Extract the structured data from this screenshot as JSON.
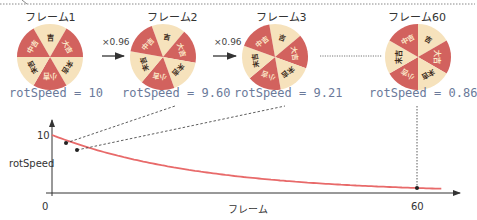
{
  "frames": [
    {
      "label": "フレーム1",
      "speed": "rotSpeed = 10",
      "rotation": 0
    },
    {
      "label": "フレーム2",
      "speed": "rotSpeed = 9.60",
      "rotation": 10
    },
    {
      "label": "フレーム3",
      "speed": "rotSpeed = 9.21",
      "rotation": 20
    },
    {
      "label": "フレーム60",
      "speed": "rotSpeed = 0.86",
      "rotation": 30
    }
  ],
  "multipliers": [
    "×0.96",
    "×0.96"
  ],
  "wheel": {
    "segments": [
      "吉",
      "大吉",
      "末吉",
      "小吉",
      "末吉",
      "中吉"
    ],
    "colors": {
      "red": "#d2625e",
      "cream": "#f6e2bc"
    }
  },
  "chart": {
    "y_label": "rotSpeed",
    "y_tick": "10",
    "x_label": "フレーム",
    "x_tick_start": "0",
    "x_tick_end": "60",
    "curve_color": "#e86a6a"
  },
  "chart_data": {
    "type": "line",
    "title": "",
    "xlabel": "フレーム",
    "ylabel": "rotSpeed",
    "x": [
      0,
      1,
      2,
      60
    ],
    "values": [
      10,
      9.6,
      9.21,
      0.86
    ],
    "formula": "rotSpeed = 10 × 0.96^frame",
    "highlighted_points": [
      {
        "frame": 1,
        "value": 9.6
      },
      {
        "frame": 2,
        "value": 9.21
      },
      {
        "frame": 60,
        "value": 0.86
      }
    ],
    "x_ticks": [
      "0",
      "60"
    ],
    "y_ticks": [
      "10"
    ],
    "grid": false
  }
}
